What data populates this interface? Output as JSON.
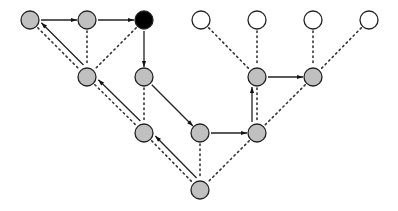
{
  "diagram": {
    "type": "tree-traversal",
    "node_radius": 9,
    "colors": {
      "visited": "#c0c0c0",
      "current": "#000000",
      "unvisited": "#ffffff",
      "stroke": "#222222"
    },
    "nodes": [
      {
        "id": "A",
        "x": 30,
        "y": 20,
        "state": "visited"
      },
      {
        "id": "B",
        "x": 87,
        "y": 20,
        "state": "visited"
      },
      {
        "id": "C",
        "x": 144,
        "y": 20,
        "state": "current"
      },
      {
        "id": "D",
        "x": 201,
        "y": 20,
        "state": "unvisited"
      },
      {
        "id": "E",
        "x": 257,
        "y": 20,
        "state": "unvisited"
      },
      {
        "id": "F",
        "x": 313,
        "y": 20,
        "state": "unvisited"
      },
      {
        "id": "G",
        "x": 369,
        "y": 20,
        "state": "unvisited"
      },
      {
        "id": "H",
        "x": 87,
        "y": 77,
        "state": "visited"
      },
      {
        "id": "I",
        "x": 144,
        "y": 77,
        "state": "visited"
      },
      {
        "id": "J",
        "x": 257,
        "y": 77,
        "state": "visited"
      },
      {
        "id": "K",
        "x": 313,
        "y": 77,
        "state": "visited"
      },
      {
        "id": "L",
        "x": 144,
        "y": 133,
        "state": "visited"
      },
      {
        "id": "M",
        "x": 200,
        "y": 133,
        "state": "visited"
      },
      {
        "id": "N",
        "x": 257,
        "y": 133,
        "state": "visited"
      },
      {
        "id": "O",
        "x": 200,
        "y": 190,
        "state": "visited"
      }
    ],
    "tree_edges": [
      [
        "A",
        "H"
      ],
      [
        "B",
        "H"
      ],
      [
        "C",
        "H"
      ],
      [
        "H",
        "L"
      ],
      [
        "I",
        "L"
      ],
      [
        "D",
        "J"
      ],
      [
        "E",
        "J"
      ],
      [
        "F",
        "K"
      ],
      [
        "G",
        "K"
      ],
      [
        "J",
        "N"
      ],
      [
        "K",
        "N"
      ],
      [
        "L",
        "O"
      ],
      [
        "M",
        "O"
      ],
      [
        "N",
        "O"
      ]
    ],
    "traversal_arrows": [
      [
        "O",
        "L"
      ],
      [
        "L",
        "H"
      ],
      [
        "H",
        "A"
      ],
      [
        "A",
        "B"
      ],
      [
        "B",
        "C"
      ],
      [
        "C",
        "I"
      ],
      [
        "I",
        "M"
      ],
      [
        "M",
        "N"
      ],
      [
        "N",
        "J"
      ],
      [
        "J",
        "K"
      ]
    ]
  }
}
